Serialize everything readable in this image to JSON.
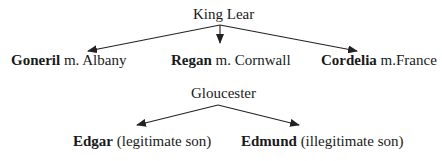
{
  "diagram": {
    "type": "family-tree",
    "families": [
      {
        "parent": "King Lear",
        "children": [
          {
            "name": "Goneril",
            "note": "m. Albany"
          },
          {
            "name": "Regan",
            "note": "m. Cornwall"
          },
          {
            "name": "Cordelia",
            "note": "m.France"
          }
        ]
      },
      {
        "parent": "Gloucester",
        "children": [
          {
            "name": "Edgar",
            "note": "(legitimate son)"
          },
          {
            "name": "Edmund",
            "note": "(illegitimate son)"
          }
        ]
      }
    ]
  },
  "colors": {
    "text": "#1a1a1a",
    "arrow": "#222222",
    "background": "#ffffff"
  }
}
